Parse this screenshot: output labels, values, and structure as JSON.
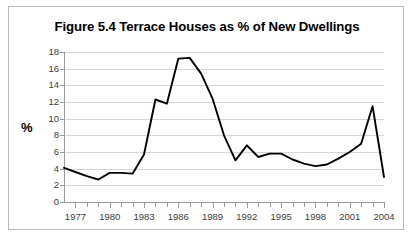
{
  "figure": {
    "title": "Figure 5.4 Terrace Houses as % of New Dwellings",
    "y_axis_title": "%",
    "border_color": "#b9b9b9",
    "gridline_color": "#d6d6d6",
    "axis_color": "#9a9a9a",
    "series_color": "#000000"
  },
  "chart_data": {
    "type": "line",
    "title": "Figure 5.4 Terrace Houses as % of New Dwellings",
    "xlabel": "",
    "ylabel": "%",
    "ylim": [
      0,
      18
    ],
    "ytick_step": 2,
    "ytick_labels": [
      "0",
      "2",
      "4",
      "6",
      "8",
      "10",
      "12",
      "14",
      "16",
      "18"
    ],
    "yticks": [
      0,
      2,
      4,
      6,
      8,
      10,
      12,
      14,
      16,
      18
    ],
    "xlim": [
      1976,
      2004
    ],
    "xtick_labels": [
      "1977",
      "1980",
      "1983",
      "1986",
      "1989",
      "1992",
      "1995",
      "1998",
      "2001",
      "2004"
    ],
    "xticks": [
      1977,
      1980,
      1983,
      1986,
      1989,
      1992,
      1995,
      1998,
      2001,
      2004
    ],
    "xtick_minor_step": 1,
    "grid": true,
    "legend": "none",
    "series": [
      {
        "name": "Terrace houses as % of new dwellings",
        "x": [
          1976,
          1977,
          1978,
          1979,
          1980,
          1981,
          1982,
          1983,
          1984,
          1985,
          1986,
          1987,
          1988,
          1989,
          1990,
          1991,
          1992,
          1993,
          1994,
          1995,
          1996,
          1997,
          1998,
          1999,
          2000,
          2001,
          2002,
          2003,
          2004
        ],
        "values": [
          4.1,
          3.6,
          3.1,
          2.7,
          3.5,
          3.5,
          3.4,
          5.7,
          12.3,
          11.8,
          17.2,
          17.3,
          15.4,
          12.4,
          8.0,
          5.0,
          6.8,
          5.4,
          5.8,
          5.8,
          5.1,
          4.6,
          4.3,
          4.5,
          5.2,
          6.0,
          7.0,
          11.5,
          3.0
        ]
      }
    ]
  }
}
